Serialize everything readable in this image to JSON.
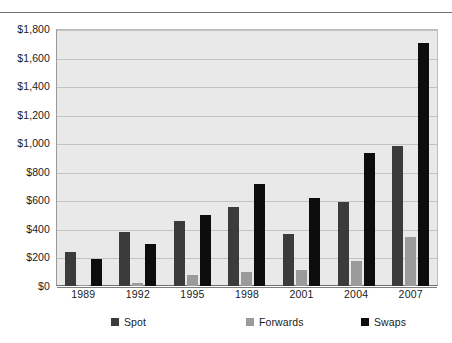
{
  "chart_data": {
    "type": "bar",
    "title": "",
    "subtitle": "",
    "xlabel": "",
    "ylabel": "",
    "categories": [
      "1989",
      "1992",
      "1995",
      "1998",
      "2001",
      "2004",
      "2007"
    ],
    "series": [
      {
        "name": "Spot",
        "color": "#3b3b3b",
        "values": [
          240,
          375,
          455,
          555,
          365,
          585,
          980
        ]
      },
      {
        "name": "Forwards",
        "color": "#9b9b9b",
        "values": [
          10,
          20,
          80,
          100,
          110,
          175,
          340
        ]
      },
      {
        "name": "Swaps",
        "color": "#0d0d0d",
        "values": [
          190,
          295,
          495,
          715,
          615,
          935,
          1700
        ]
      }
    ],
    "ylim": [
      0,
      1800
    ],
    "ytick_values": [
      0,
      200,
      400,
      600,
      800,
      1000,
      1200,
      1400,
      1600,
      1800
    ],
    "ytick_labels": [
      "$0",
      "$200",
      "$400",
      "$600",
      "$800",
      "$1,000",
      "$1,200",
      "$1,400",
      "$1,600",
      "$1,800"
    ],
    "grid": true,
    "grid_axis": "y",
    "legend_position": "bottom",
    "plot_background": "#e9e9e9",
    "gridline_color": "#c2c2c2"
  }
}
